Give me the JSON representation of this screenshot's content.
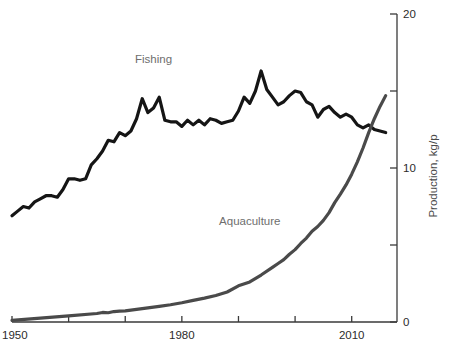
{
  "chart_data": {
    "type": "line",
    "title": "",
    "xlabel": "",
    "ylabel": "Production, kg/p",
    "xlim": [
      1950,
      2018
    ],
    "ylim": [
      0,
      20
    ],
    "grid": false,
    "legend_position": "inline-labels",
    "y_axis_side": "right",
    "x_tick_labels": [
      "1950",
      "1980",
      "2010"
    ],
    "x_tick_values": [
      1950,
      1980,
      2010
    ],
    "x_minor_tick_values": [
      1960,
      1970,
      1990,
      2000
    ],
    "y_tick_labels": [
      "0",
      "10",
      "20"
    ],
    "y_tick_values": [
      0,
      10,
      20
    ],
    "y_minor_tick_values": [
      5,
      15
    ],
    "annotations": [
      {
        "text": "Fishing",
        "x": 1975,
        "y": 16.8,
        "color": "#6e6e6e"
      },
      {
        "text": "Aquaculture",
        "x": 1992,
        "y": 6.3,
        "color": "#6e6e6e"
      }
    ],
    "series": [
      {
        "name": "Fishing",
        "color": "#151515",
        "stroke_width": 3.2,
        "label": "Fishing",
        "x": [
          1950,
          1951,
          1952,
          1953,
          1954,
          1955,
          1956,
          1957,
          1958,
          1959,
          1960,
          1961,
          1962,
          1963,
          1964,
          1965,
          1966,
          1967,
          1968,
          1969,
          1970,
          1971,
          1972,
          1973,
          1974,
          1975,
          1976,
          1977,
          1978,
          1979,
          1980,
          1981,
          1982,
          1983,
          1984,
          1985,
          1986,
          1987,
          1988,
          1989,
          1990,
          1991,
          1992,
          1993,
          1994,
          1995,
          1996,
          1997,
          1998,
          1999,
          2000,
          2001,
          2002,
          2003,
          2004,
          2005,
          2006,
          2007,
          2008,
          2009,
          2010,
          2011,
          2012,
          2013,
          2014,
          2015,
          2016
        ],
        "values": [
          6.9,
          7.2,
          7.5,
          7.4,
          7.8,
          8.0,
          8.2,
          8.2,
          8.1,
          8.6,
          9.3,
          9.3,
          9.2,
          9.3,
          10.2,
          10.6,
          11.1,
          11.8,
          11.7,
          12.3,
          12.1,
          12.4,
          13.2,
          14.5,
          13.6,
          13.9,
          14.6,
          13.1,
          13.0,
          13.0,
          12.7,
          13.1,
          12.8,
          13.1,
          12.8,
          13.2,
          13.1,
          12.9,
          13.0,
          13.1,
          13.7,
          14.6,
          14.2,
          15.0,
          16.3,
          15.1,
          14.6,
          14.1,
          14.3,
          14.7,
          15.0,
          14.9,
          14.3,
          14.1,
          13.3,
          13.8,
          14.0,
          13.6,
          13.3,
          13.5,
          13.3,
          12.8,
          12.6,
          12.8,
          12.5,
          12.4,
          12.3
        ]
      },
      {
        "name": "Aquaculture",
        "color": "#4a4a4a",
        "stroke_width": 3.2,
        "label": "Aquaculture",
        "x": [
          1950,
          1955,
          1960,
          1965,
          1966,
          1967,
          1968,
          1969,
          1970,
          1972,
          1974,
          1976,
          1978,
          1980,
          1982,
          1984,
          1986,
          1988,
          1990,
          1992,
          1994,
          1996,
          1997,
          1998,
          1999,
          2000,
          2001,
          2002,
          2003,
          2004,
          2005,
          2006,
          2007,
          2008,
          2009,
          2010,
          2011,
          2012,
          2013,
          2014,
          2015,
          2016
        ],
        "values": [
          0.1,
          0.25,
          0.4,
          0.55,
          0.62,
          0.6,
          0.68,
          0.7,
          0.72,
          0.82,
          0.92,
          1.02,
          1.12,
          1.25,
          1.4,
          1.55,
          1.72,
          1.95,
          2.35,
          2.6,
          3.05,
          3.55,
          3.8,
          4.05,
          4.4,
          4.7,
          5.1,
          5.45,
          5.9,
          6.2,
          6.6,
          7.1,
          7.75,
          8.3,
          8.9,
          9.6,
          10.4,
          11.3,
          12.3,
          13.2,
          14.0,
          14.7
        ]
      }
    ]
  }
}
